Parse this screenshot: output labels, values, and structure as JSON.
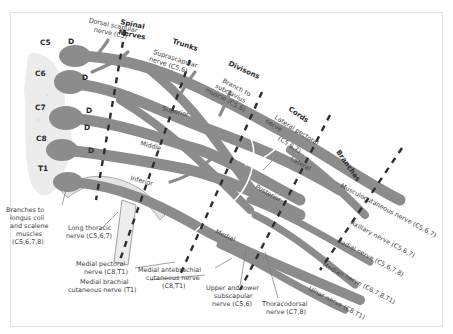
{
  "diagram": {
    "colors": {
      "nerve": "#8c8c8c",
      "divider": "#2e2e2e",
      "label": "#3e3e3e",
      "frame": "#e2e2e2"
    },
    "section_headings": [
      "Spinal",
      "Nerves",
      "Trunks",
      "Divisons",
      "Cords",
      "Branches"
    ],
    "spinal_levels": [
      "C5",
      "C6",
      "C7",
      "C8",
      "T1"
    ],
    "dorsal_marker": "D",
    "trunks": [
      "Superior",
      "Middle",
      "Inferior"
    ],
    "cords": [
      "Lateral",
      "Posterior",
      "Medial"
    ],
    "labels": {
      "dorsal_scapular": [
        "Dorsal scapular",
        "nerve (C5)"
      ],
      "suprascapular": [
        "Suprascapular",
        "nerve (C5,6)"
      ],
      "subclavius": [
        "Branch to",
        "subclavius",
        "muscle (C5,6)"
      ],
      "lateral_pectoral": [
        "Lateral pectoral",
        "nerve",
        "(C5,6,7)"
      ],
      "longus": [
        "Branches to",
        "longus coli",
        "and scalene",
        "muscles",
        "(C5,6,7,8)"
      ],
      "long_thoracic": [
        "Long thoracic",
        "nerve (C5,6,7)"
      ],
      "medial_pectoral": [
        "Medial pectoral",
        "nerve (C8,T1)"
      ],
      "medial_brachial": [
        "Medial brachial",
        "cutaneous nerve (T1)"
      ],
      "medial_antebrachial": [
        "Medial antebrachial",
        "cutaneous nerve",
        "(C8,T1)"
      ],
      "subscapular": [
        "Upper and lower",
        "subscapular",
        "nerve (C5,6)"
      ],
      "thoracodorsal": [
        "Thoracodorsal",
        "nerve (C7,8)"
      ]
    },
    "branches": [
      "Musculocutaneous nerve (C5,6,7)",
      "Axillary nerve (C5,6,7)",
      "Radial nerve (C5,6,7,8)",
      "Median nerve (C6,7,8,T1)",
      "Ulnar nerve (C8,T1)"
    ]
  }
}
